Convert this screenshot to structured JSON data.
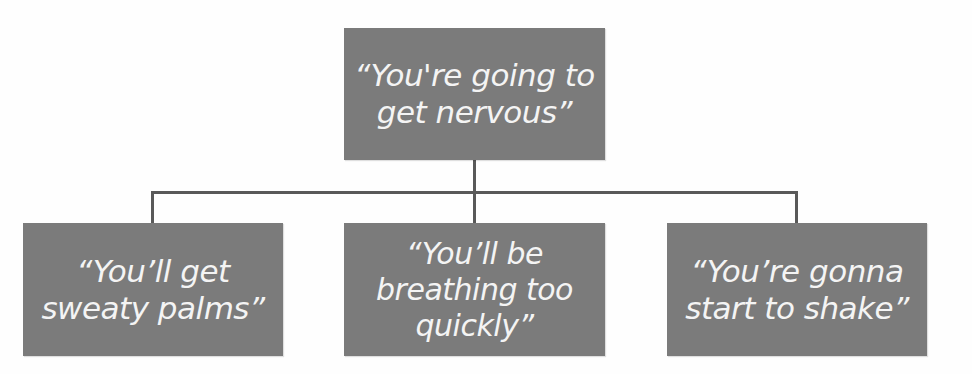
{
  "diagram": {
    "type": "hierarchy",
    "colors": {
      "node_fill": "#7b7b7b",
      "node_text": "#f4f4f4",
      "connector": "#595959",
      "background": "#ffffff"
    },
    "root": {
      "lines": [
        "“You're going to",
        "get nervous”"
      ]
    },
    "children": [
      {
        "lines": [
          "“You’ll get",
          "sweaty palms”"
        ]
      },
      {
        "lines": [
          "“You’ll be",
          "breathing too",
          "quickly”"
        ]
      },
      {
        "lines": [
          "“You’re gonna",
          "start to shake”"
        ]
      }
    ]
  }
}
